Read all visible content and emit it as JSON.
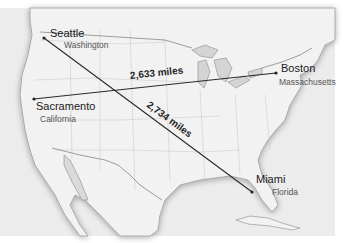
{
  "map": {
    "region": "United States",
    "style": "grayscale",
    "cities": [
      {
        "name": "Seattle",
        "state": "Washington"
      },
      {
        "name": "Sacramento",
        "state": "California"
      },
      {
        "name": "Boston",
        "state": "Massachusetts"
      },
      {
        "name": "Miami",
        "state": "Florida"
      }
    ],
    "routes": [
      {
        "from": "Sacramento",
        "to": "Boston",
        "label": "2,633 miles"
      },
      {
        "from": "Seattle",
        "to": "Miami",
        "label": "2,734 miles"
      }
    ]
  }
}
